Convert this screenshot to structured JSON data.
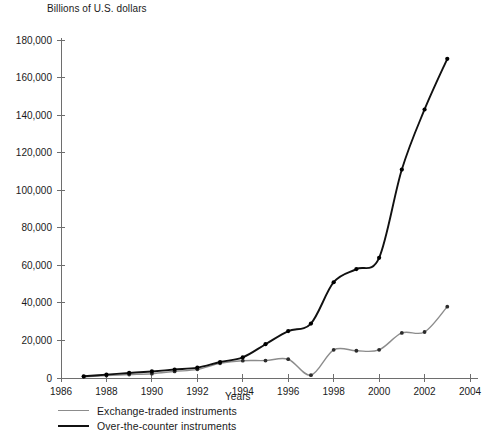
{
  "chart_data": {
    "type": "line",
    "title": "Billions of U.S. dollars",
    "xlabel": "Years",
    "ylabel": "Billions of U.S. dollars",
    "xlim": [
      1986,
      2004
    ],
    "ylim": [
      0,
      180000
    ],
    "grid": false,
    "legend_position": "bottom-left",
    "y_ticks": [
      0,
      20000,
      40000,
      60000,
      80000,
      100000,
      120000,
      140000,
      160000,
      180000
    ],
    "y_tick_labels": [
      "0",
      "20,000",
      "40,000",
      "60,000",
      "80,000",
      "100,000",
      "120,000",
      "140,000",
      "160,000",
      "180,000"
    ],
    "x_ticks": [
      1986,
      1988,
      1990,
      1992,
      1994,
      1996,
      1998,
      2000,
      2002,
      2004
    ],
    "x_tick_labels": [
      "1986",
      "1988",
      "1990",
      "1992",
      "1994",
      "1996",
      "1998",
      "2000",
      "2002",
      "2004"
    ],
    "x": [
      1987,
      1988,
      1989,
      1990,
      1991,
      1992,
      1993,
      1994,
      1995,
      1996,
      1997,
      1998,
      1999,
      2000,
      2001,
      2002,
      2003
    ],
    "series": [
      {
        "name": "Exchange-traded instruments",
        "color": "#8c8c8c",
        "values": [
          700,
          1300,
          1800,
          2300,
          3500,
          4600,
          7800,
          9200,
          9300,
          10000,
          1500,
          15000,
          14500,
          15000,
          24000,
          24500,
          38000
        ]
      },
      {
        "name": "Over-the-counter instruments",
        "color": "#111111",
        "values": [
          900,
          1800,
          2700,
          3500,
          4500,
          5500,
          8500,
          11000,
          18000,
          25000,
          29000,
          51000,
          58000,
          64000,
          111000,
          143000,
          170000
        ]
      }
    ]
  },
  "legend": [
    {
      "label": "Exchange-traded instruments"
    },
    {
      "label": "Over-the-counter instruments"
    }
  ]
}
